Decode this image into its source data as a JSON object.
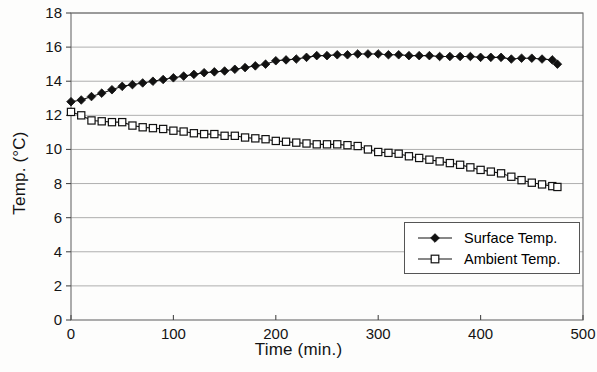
{
  "chart_data": {
    "type": "line",
    "title": "",
    "xlabel": "Time (min.)",
    "ylabel": "Temp. (°C)",
    "xlim": [
      0,
      500
    ],
    "ylim": [
      0,
      18
    ],
    "xticks": [
      0,
      100,
      200,
      300,
      400,
      500
    ],
    "yticks": [
      0,
      2,
      4,
      6,
      8,
      10,
      12,
      14,
      16,
      18
    ],
    "grid": "horizontal",
    "legend_position": "lower right",
    "series": [
      {
        "name": "Surface Temp.",
        "marker": "filled-diamond",
        "color": "#111111",
        "x": [
          0,
          10,
          20,
          30,
          40,
          50,
          60,
          70,
          80,
          90,
          100,
          110,
          120,
          130,
          140,
          150,
          160,
          170,
          180,
          190,
          200,
          210,
          220,
          230,
          240,
          250,
          260,
          270,
          280,
          290,
          300,
          310,
          320,
          330,
          340,
          350,
          360,
          370,
          380,
          390,
          400,
          410,
          420,
          430,
          440,
          450,
          460,
          470,
          475
        ],
        "y": [
          12.8,
          12.9,
          13.1,
          13.3,
          13.5,
          13.7,
          13.8,
          13.9,
          14.0,
          14.1,
          14.2,
          14.3,
          14.4,
          14.5,
          14.55,
          14.6,
          14.7,
          14.8,
          14.9,
          15.0,
          15.2,
          15.25,
          15.3,
          15.4,
          15.5,
          15.5,
          15.55,
          15.55,
          15.6,
          15.6,
          15.6,
          15.55,
          15.55,
          15.5,
          15.5,
          15.5,
          15.45,
          15.45,
          15.45,
          15.45,
          15.4,
          15.4,
          15.4,
          15.3,
          15.35,
          15.35,
          15.3,
          15.25,
          15.0
        ]
      },
      {
        "name": "Ambient Temp.",
        "marker": "open-square",
        "color": "#111111",
        "x": [
          0,
          10,
          20,
          30,
          40,
          50,
          60,
          70,
          80,
          90,
          100,
          110,
          120,
          130,
          140,
          150,
          160,
          170,
          180,
          190,
          200,
          210,
          220,
          230,
          240,
          250,
          260,
          270,
          280,
          290,
          300,
          310,
          320,
          330,
          340,
          350,
          360,
          370,
          380,
          390,
          400,
          410,
          420,
          430,
          440,
          450,
          460,
          470,
          475
        ],
        "y": [
          12.2,
          12.0,
          11.7,
          11.65,
          11.6,
          11.6,
          11.4,
          11.3,
          11.25,
          11.2,
          11.1,
          11.05,
          10.95,
          10.9,
          10.9,
          10.8,
          10.8,
          10.7,
          10.65,
          10.6,
          10.5,
          10.45,
          10.4,
          10.35,
          10.3,
          10.3,
          10.3,
          10.25,
          10.2,
          10.0,
          9.85,
          9.8,
          9.75,
          9.6,
          9.5,
          9.4,
          9.3,
          9.2,
          9.1,
          8.95,
          8.8,
          8.7,
          8.6,
          8.4,
          8.2,
          8.05,
          7.95,
          7.85,
          7.8
        ]
      }
    ]
  },
  "legend": {
    "entries": [
      {
        "label": "Surface Temp."
      },
      {
        "label": "Ambient Temp."
      }
    ]
  }
}
